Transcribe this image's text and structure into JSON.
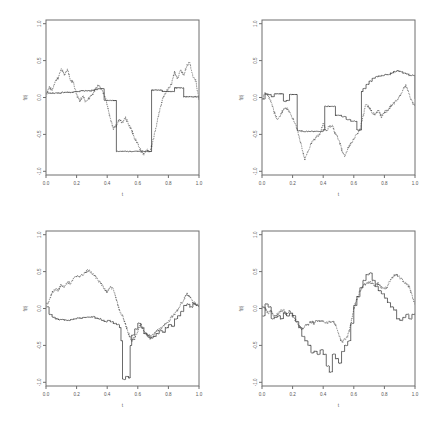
{
  "figure": {
    "title": "",
    "layout": "2x2 panel grid",
    "background": "#ffffff",
    "panel_count": 4
  },
  "axes": {
    "xlabel": "t",
    "ylabel": "f(t)",
    "xticks": [
      "0.0",
      "0.2",
      "0.4",
      "0.6",
      "0.8",
      "1.0"
    ],
    "xtick_values": [
      0.0,
      0.2,
      0.4,
      0.6,
      0.8,
      1.0
    ],
    "yticks": [
      "-1.0",
      "-0.5",
      "0.0",
      "0.5",
      "1.0"
    ],
    "ytick_values": [
      -1.0,
      -0.5,
      0.0,
      0.5,
      1.0
    ],
    "xlim": [
      0.0,
      1.0
    ],
    "ylim": [
      -1.05,
      1.05
    ],
    "grid": false,
    "frame": true,
    "axis_color": "#6e6e6e",
    "label_color": "#555555"
  },
  "series_styles": {
    "estimate": {
      "name": "estimate",
      "style": "solid",
      "color": "#2b2b2b"
    },
    "observed": {
      "name": "observed",
      "style": "dotted",
      "color": "#3a3a3a"
    }
  },
  "chart_data": [
    {
      "type": "line",
      "panel": "top-left",
      "title": "",
      "xlabel": "t",
      "ylabel": "f(t)",
      "xlim": [
        0.0,
        1.0
      ],
      "ylim": [
        -1.05,
        1.05
      ],
      "xticks": [
        0.0,
        0.2,
        0.4,
        0.6,
        0.8,
        1.0
      ],
      "yticks": [
        -1.0,
        -0.5,
        0.0,
        0.5,
        1.0
      ],
      "grid": false,
      "legend": "none",
      "series": [
        {
          "name": "estimate",
          "style": "solid",
          "x": [
            0.0,
            0.02,
            0.04,
            0.06,
            0.08,
            0.1,
            0.12,
            0.14,
            0.16,
            0.18,
            0.2,
            0.22,
            0.24,
            0.26,
            0.28,
            0.3,
            0.32,
            0.34,
            0.36,
            0.38,
            0.4,
            0.42,
            0.44,
            0.45,
            0.46,
            0.5,
            0.55,
            0.6,
            0.65,
            0.68,
            0.69,
            0.7,
            0.72,
            0.74,
            0.76,
            0.78,
            0.8,
            0.82,
            0.84,
            0.85,
            0.86,
            0.88,
            0.9,
            0.92,
            0.94,
            0.96,
            0.98,
            1.0
          ],
          "values": [
            0.06,
            0.06,
            0.06,
            0.06,
            0.06,
            0.07,
            0.07,
            0.07,
            0.07,
            0.08,
            0.08,
            0.09,
            0.09,
            0.09,
            0.09,
            0.1,
            0.11,
            0.12,
            0.12,
            -0.04,
            -0.04,
            -0.04,
            -0.04,
            -0.04,
            -0.73,
            -0.73,
            -0.73,
            -0.73,
            -0.73,
            -0.73,
            0.1,
            0.1,
            0.1,
            0.1,
            0.08,
            0.08,
            0.08,
            0.08,
            0.13,
            0.13,
            0.13,
            0.13,
            0.01,
            0.01,
            0.01,
            0.01,
            0.01,
            -0.03
          ]
        },
        {
          "name": "observed",
          "style": "dotted",
          "x": [
            0.0,
            0.02,
            0.04,
            0.06,
            0.08,
            0.1,
            0.12,
            0.14,
            0.16,
            0.18,
            0.2,
            0.22,
            0.24,
            0.26,
            0.28,
            0.3,
            0.32,
            0.34,
            0.36,
            0.38,
            0.4,
            0.42,
            0.44,
            0.46,
            0.48,
            0.5,
            0.52,
            0.54,
            0.56,
            0.58,
            0.6,
            0.62,
            0.64,
            0.66,
            0.68,
            0.7,
            0.72,
            0.74,
            0.76,
            0.78,
            0.8,
            0.82,
            0.84,
            0.86,
            0.88,
            0.9,
            0.92,
            0.94,
            0.96,
            0.98,
            1.0
          ],
          "values": [
            0.02,
            0.14,
            0.1,
            0.22,
            0.26,
            0.4,
            0.3,
            0.38,
            0.24,
            0.2,
            0.04,
            -0.05,
            0.02,
            -0.06,
            -0.01,
            0.03,
            0.1,
            0.16,
            0.12,
            0.04,
            -0.1,
            -0.28,
            -0.42,
            -0.38,
            -0.3,
            -0.34,
            -0.28,
            -0.36,
            -0.44,
            -0.56,
            -0.62,
            -0.72,
            -0.76,
            -0.7,
            -0.74,
            -0.58,
            -0.4,
            -0.2,
            -0.04,
            0.06,
            0.12,
            0.18,
            0.34,
            0.26,
            0.38,
            0.3,
            0.44,
            0.48,
            0.28,
            0.22,
            -0.04
          ]
        }
      ]
    },
    {
      "type": "line",
      "panel": "top-right",
      "title": "",
      "xlabel": "t",
      "ylabel": "f(t)",
      "xlim": [
        0.0,
        1.0
      ],
      "ylim": [
        -1.05,
        1.05
      ],
      "xticks": [
        0.0,
        0.2,
        0.4,
        0.6,
        0.8,
        1.0
      ],
      "yticks": [
        -1.0,
        -0.5,
        0.0,
        0.5,
        1.0
      ],
      "grid": false,
      "legend": "none",
      "series": [
        {
          "name": "estimate",
          "style": "solid",
          "x": [
            0.0,
            0.02,
            0.04,
            0.06,
            0.08,
            0.1,
            0.12,
            0.14,
            0.16,
            0.18,
            0.2,
            0.22,
            0.23,
            0.26,
            0.3,
            0.34,
            0.38,
            0.4,
            0.41,
            0.44,
            0.45,
            0.48,
            0.5,
            0.52,
            0.55,
            0.58,
            0.62,
            0.64,
            0.65,
            0.66,
            0.68,
            0.7,
            0.72,
            0.74,
            0.76,
            0.78,
            0.8,
            0.82,
            0.84,
            0.86,
            0.88,
            0.9,
            0.92,
            0.94,
            0.96,
            0.98,
            1.0
          ],
          "values": [
            -0.02,
            0.05,
            0.04,
            0.01,
            0.05,
            0.05,
            0.05,
            -0.05,
            -0.04,
            0.04,
            0.04,
            0.04,
            -0.45,
            -0.46,
            -0.46,
            -0.46,
            -0.46,
            -0.44,
            -0.12,
            -0.12,
            -0.12,
            -0.24,
            -0.24,
            -0.26,
            -0.3,
            -0.32,
            -0.44,
            -0.44,
            0.08,
            0.12,
            0.18,
            0.22,
            0.26,
            0.28,
            0.29,
            0.3,
            0.31,
            0.31,
            0.33,
            0.35,
            0.36,
            0.35,
            0.33,
            0.32,
            0.3,
            0.3,
            -0.02
          ]
        },
        {
          "name": "observed",
          "style": "dotted",
          "x": [
            0.0,
            0.02,
            0.04,
            0.06,
            0.08,
            0.1,
            0.12,
            0.14,
            0.16,
            0.18,
            0.2,
            0.22,
            0.24,
            0.26,
            0.28,
            0.3,
            0.32,
            0.34,
            0.36,
            0.38,
            0.4,
            0.42,
            0.44,
            0.46,
            0.48,
            0.5,
            0.52,
            0.54,
            0.56,
            0.58,
            0.6,
            0.62,
            0.64,
            0.66,
            0.68,
            0.7,
            0.72,
            0.74,
            0.76,
            0.78,
            0.8,
            0.82,
            0.84,
            0.86,
            0.88,
            0.9,
            0.92,
            0.94,
            0.96,
            0.98,
            1.0
          ],
          "values": [
            -0.04,
            0.06,
            0.02,
            -0.06,
            -0.2,
            -0.3,
            -0.24,
            -0.16,
            -0.14,
            -0.2,
            -0.28,
            -0.36,
            -0.5,
            -0.68,
            -0.84,
            -0.74,
            -0.62,
            -0.58,
            -0.52,
            -0.5,
            -0.34,
            -0.44,
            -0.4,
            -0.38,
            -0.5,
            -0.56,
            -0.7,
            -0.8,
            -0.7,
            -0.62,
            -0.56,
            -0.5,
            -0.44,
            -0.26,
            -0.08,
            -0.14,
            -0.2,
            -0.24,
            -0.16,
            -0.26,
            -0.2,
            -0.18,
            -0.12,
            -0.08,
            -0.04,
            0.02,
            0.1,
            0.16,
            0.06,
            -0.06,
            -0.1
          ]
        }
      ]
    },
    {
      "type": "line",
      "panel": "bottom-left",
      "title": "",
      "xlabel": "t",
      "ylabel": "f(t)",
      "xlim": [
        0.0,
        1.0
      ],
      "ylim": [
        -1.05,
        1.05
      ],
      "xticks": [
        0.0,
        0.2,
        0.4,
        0.6,
        0.8,
        1.0
      ],
      "yticks": [
        -1.0,
        -0.5,
        0.0,
        0.5,
        1.0
      ],
      "grid": false,
      "legend": "none",
      "series": [
        {
          "name": "estimate",
          "style": "solid",
          "x": [
            0.0,
            0.02,
            0.04,
            0.06,
            0.08,
            0.1,
            0.12,
            0.14,
            0.16,
            0.18,
            0.2,
            0.22,
            0.24,
            0.26,
            0.28,
            0.3,
            0.32,
            0.34,
            0.36,
            0.38,
            0.4,
            0.42,
            0.44,
            0.46,
            0.48,
            0.49,
            0.5,
            0.52,
            0.54,
            0.55,
            0.56,
            0.58,
            0.6,
            0.62,
            0.64,
            0.66,
            0.68,
            0.7,
            0.72,
            0.74,
            0.76,
            0.78,
            0.8,
            0.82,
            0.84,
            0.86,
            0.88,
            0.9,
            0.92,
            0.94,
            0.96,
            0.98,
            1.0
          ],
          "values": [
            0.02,
            -0.08,
            -0.12,
            -0.14,
            -0.15,
            -0.15,
            -0.16,
            -0.16,
            -0.15,
            -0.14,
            -0.13,
            -0.13,
            -0.12,
            -0.12,
            -0.12,
            -0.11,
            -0.13,
            -0.14,
            -0.16,
            -0.18,
            -0.16,
            -0.18,
            -0.2,
            -0.22,
            -0.26,
            -0.44,
            -0.96,
            -0.92,
            -0.94,
            -0.5,
            -0.36,
            -0.28,
            -0.2,
            -0.26,
            -0.34,
            -0.36,
            -0.4,
            -0.38,
            -0.34,
            -0.3,
            -0.32,
            -0.26,
            -0.22,
            -0.24,
            -0.14,
            -0.1,
            -0.04,
            0.04,
            0.06,
            0.02,
            0.06,
            0.04,
            0.02
          ]
        },
        {
          "name": "observed",
          "style": "dotted",
          "x": [
            0.0,
            0.02,
            0.04,
            0.06,
            0.08,
            0.1,
            0.12,
            0.14,
            0.16,
            0.18,
            0.2,
            0.22,
            0.24,
            0.26,
            0.28,
            0.3,
            0.32,
            0.34,
            0.36,
            0.38,
            0.4,
            0.42,
            0.44,
            0.46,
            0.48,
            0.5,
            0.52,
            0.54,
            0.56,
            0.58,
            0.6,
            0.62,
            0.64,
            0.66,
            0.68,
            0.7,
            0.72,
            0.74,
            0.76,
            0.78,
            0.8,
            0.82,
            0.84,
            0.86,
            0.88,
            0.9,
            0.92,
            0.94,
            0.96,
            0.98,
            1.0
          ],
          "values": [
            0.04,
            0.1,
            0.22,
            0.26,
            0.24,
            0.32,
            0.3,
            0.36,
            0.34,
            0.4,
            0.44,
            0.42,
            0.46,
            0.5,
            0.52,
            0.48,
            0.44,
            0.38,
            0.34,
            0.28,
            0.22,
            0.3,
            0.26,
            0.12,
            -0.02,
            -0.1,
            -0.22,
            -0.34,
            -0.44,
            -0.4,
            -0.3,
            -0.22,
            -0.3,
            -0.36,
            -0.4,
            -0.36,
            -0.32,
            -0.28,
            -0.26,
            -0.2,
            -0.18,
            -0.12,
            -0.08,
            -0.02,
            0.06,
            0.12,
            0.2,
            0.16,
            0.08,
            0.06,
            0.04
          ]
        }
      ]
    },
    {
      "type": "line",
      "panel": "bottom-right",
      "title": "",
      "xlabel": "t",
      "ylabel": "f(t)",
      "xlim": [
        0.0,
        1.0
      ],
      "ylim": [
        -1.05,
        1.05
      ],
      "xticks": [
        0.0,
        0.2,
        0.4,
        0.6,
        0.8,
        1.0
      ],
      "yticks": [
        -1.0,
        -0.5,
        0.0,
        0.5,
        1.0
      ],
      "grid": false,
      "legend": "none",
      "series": [
        {
          "name": "estimate",
          "style": "solid",
          "x": [
            0.0,
            0.02,
            0.04,
            0.06,
            0.08,
            0.1,
            0.12,
            0.14,
            0.16,
            0.18,
            0.2,
            0.22,
            0.24,
            0.26,
            0.28,
            0.3,
            0.32,
            0.34,
            0.36,
            0.38,
            0.4,
            0.42,
            0.44,
            0.46,
            0.48,
            0.5,
            0.52,
            0.54,
            0.56,
            0.58,
            0.6,
            0.62,
            0.64,
            0.66,
            0.68,
            0.7,
            0.72,
            0.74,
            0.76,
            0.78,
            0.8,
            0.82,
            0.84,
            0.86,
            0.88,
            0.9,
            0.92,
            0.94,
            0.96,
            0.98,
            1.0
          ],
          "values": [
            -0.1,
            0.06,
            0.02,
            -0.14,
            -0.12,
            -0.1,
            -0.14,
            -0.06,
            -0.1,
            -0.06,
            -0.1,
            -0.18,
            -0.26,
            -0.38,
            -0.44,
            -0.5,
            -0.6,
            -0.58,
            -0.62,
            -0.56,
            -0.62,
            -0.78,
            -0.86,
            -0.62,
            -0.68,
            -0.74,
            -0.58,
            -0.5,
            -0.44,
            -0.2,
            0.04,
            0.16,
            0.28,
            0.38,
            0.46,
            0.48,
            0.38,
            0.3,
            0.24,
            0.2,
            0.14,
            0.08,
            0.02,
            -0.02,
            -0.14,
            -0.16,
            -0.12,
            -0.08,
            -0.14,
            -0.08,
            -0.06
          ]
        },
        {
          "name": "observed",
          "style": "dotted",
          "x": [
            0.0,
            0.02,
            0.04,
            0.06,
            0.08,
            0.1,
            0.12,
            0.14,
            0.16,
            0.18,
            0.2,
            0.22,
            0.24,
            0.26,
            0.28,
            0.3,
            0.32,
            0.34,
            0.36,
            0.38,
            0.4,
            0.42,
            0.44,
            0.46,
            0.48,
            0.5,
            0.52,
            0.54,
            0.56,
            0.58,
            0.6,
            0.62,
            0.64,
            0.66,
            0.68,
            0.7,
            0.72,
            0.74,
            0.76,
            0.78,
            0.8,
            0.82,
            0.84,
            0.86,
            0.88,
            0.9,
            0.92,
            0.94,
            0.96,
            0.98,
            1.0
          ],
          "values": [
            0.02,
            0.0,
            -0.06,
            -0.04,
            -0.1,
            -0.08,
            -0.04,
            -0.02,
            -0.08,
            -0.04,
            -0.1,
            -0.16,
            -0.22,
            -0.28,
            -0.24,
            -0.22,
            -0.18,
            -0.2,
            -0.16,
            -0.18,
            -0.16,
            -0.2,
            -0.18,
            -0.16,
            -0.22,
            -0.34,
            -0.46,
            -0.42,
            -0.38,
            -0.22,
            0.0,
            0.12,
            0.24,
            0.3,
            0.34,
            0.36,
            0.34,
            0.3,
            0.34,
            0.28,
            0.26,
            0.3,
            0.38,
            0.44,
            0.46,
            0.42,
            0.38,
            0.34,
            0.3,
            0.18,
            0.06
          ]
        }
      ]
    }
  ]
}
